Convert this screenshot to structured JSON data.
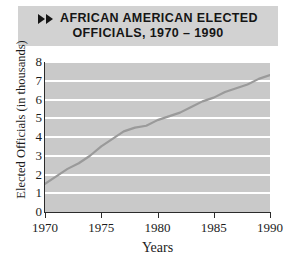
{
  "title": {
    "icon": "double-right-arrow-icon",
    "line1": "AFRICAN AMERICAN ELECTED",
    "line2": "OFFICIALS, 1970 – 1990",
    "banner_color": "#d2d2d2",
    "text_color": "#151515"
  },
  "chart_data": {
    "type": "line",
    "title": "AFRICAN AMERICAN ELECTED OFFICIALS, 1970 – 1990",
    "xlabel": "Years",
    "ylabel": "Elected Officials (in thousands)",
    "xlim": [
      1970,
      1990
    ],
    "ylim": [
      0,
      8
    ],
    "grid": true,
    "legend": "none",
    "plot_background": "#c9c9c9",
    "gridline_color": "#ffffff",
    "line_color": "#9a9a9a",
    "xticks": [
      1970,
      1975,
      1980,
      1985,
      1990
    ],
    "xtick_labels": [
      "1970",
      "1975",
      "1980",
      "1985",
      "1990"
    ],
    "yticks": [
      0,
      1,
      2,
      3,
      4,
      5,
      6,
      7,
      8
    ],
    "ytick_labels": [
      "0",
      "1",
      "2",
      "3",
      "4",
      "5",
      "6",
      "7",
      "8"
    ],
    "x": [
      1970,
      1971,
      1972,
      1973,
      1974,
      1975,
      1976,
      1977,
      1978,
      1979,
      1980,
      1981,
      1982,
      1983,
      1984,
      1985,
      1986,
      1987,
      1988,
      1989,
      1990
    ],
    "values": [
      1.5,
      1.9,
      2.3,
      2.6,
      3.0,
      3.5,
      3.9,
      4.3,
      4.5,
      4.6,
      4.9,
      5.1,
      5.3,
      5.6,
      5.9,
      6.1,
      6.4,
      6.6,
      6.8,
      7.1,
      7.3
    ]
  }
}
